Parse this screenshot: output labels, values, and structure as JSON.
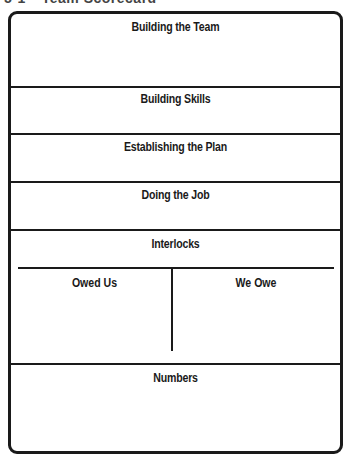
{
  "caption": {
    "figure_number": "5-1",
    "title": "Team Scorecard"
  },
  "scorecard": {
    "sections": [
      {
        "label": "Building the Team"
      },
      {
        "label": "Building Skills"
      },
      {
        "label": "Establishing the Plan"
      },
      {
        "label": "Doing the Job"
      },
      {
        "label": "Interlocks"
      },
      {
        "label": "Numbers"
      }
    ],
    "interlocks": {
      "left_column": "Owed Us",
      "right_column": "We Owe"
    }
  }
}
